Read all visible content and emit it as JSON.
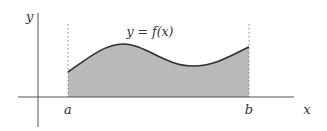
{
  "diagram": {
    "curve_label": "y = f(x)",
    "axes": {
      "x_label": "x",
      "y_label": "y"
    },
    "bounds": {
      "lower_label": "a",
      "upper_label": "b"
    },
    "colors": {
      "fill": "#b9b9b9",
      "curve": "#2f2f2f",
      "axis": "#555555",
      "dotted": "#888888",
      "text": "#333333"
    }
  }
}
